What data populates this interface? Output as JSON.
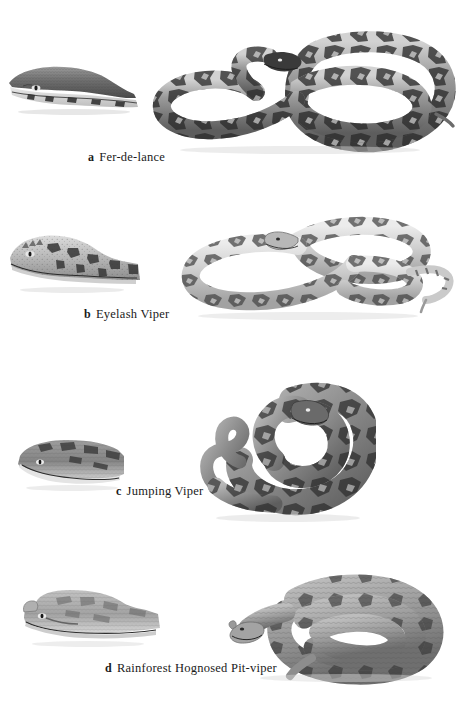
{
  "plate": {
    "background_color": "#ffffff",
    "ink_color": "#1a1a1a",
    "width": 460,
    "height": 718,
    "style": "grayscale halftone scientific illustration plate"
  },
  "figures": [
    {
      "key": "a",
      "label": "a",
      "name": "Fer-de-lance",
      "head_view": "lateral head close-up, dark dorsal surface with pale cream labial scales",
      "body_view": "full body coiled in double loop, dark diamond and triangular dorsal blotches",
      "caption_x": 88,
      "caption_y": 158,
      "tone_dark": "#3b3b3b",
      "tone_mid": "#8e8e8e",
      "tone_light": "#d8d8d8"
    },
    {
      "key": "b",
      "label": "b",
      "name": "Eyelash Viper",
      "head_view": "lateral head close-up, pale speckled head with dark blotches and raised supraocular scales",
      "body_view": "full body in loose S-coils, pale ground colour with dark irregular blotches, slender tail",
      "caption_x": 84,
      "caption_y": 315,
      "tone_dark": "#4a4a4a",
      "tone_mid": "#a0a0a0",
      "tone_light": "#e2e2e2"
    },
    {
      "key": "c",
      "label": "c",
      "name": "Jumping Viper",
      "head_view": "lateral head close-up, broad blunt head, mottled grey with pale lower jaw",
      "body_view": "heavy-bodied snake coiled tightly with raised head and short prehensile tail",
      "caption_x": 116,
      "caption_y": 492,
      "tone_dark": "#3f3f3f",
      "tone_mid": "#8a8a8a",
      "tone_light": "#d0d0d0"
    },
    {
      "key": "d",
      "label": "d",
      "name": "Rainforest Hognosed Pit-viper",
      "head_view": "lateral head close-up, strongly upturned snout, uniform grey keeled scales",
      "body_view": "short stout body coiled, keeled grey scales with dark lateral blotches",
      "caption_x": 105,
      "caption_y": 669,
      "tone_dark": "#464646",
      "tone_mid": "#949494",
      "tone_light": "#dcdcdc"
    }
  ]
}
